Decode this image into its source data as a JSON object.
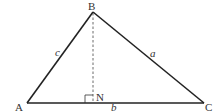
{
  "diagram": {
    "type": "triangle-with-altitude",
    "vertices": {
      "A": {
        "label": "A",
        "x": 27,
        "y": 103
      },
      "B": {
        "label": "B",
        "x": 93,
        "y": 12
      },
      "C": {
        "label": "C",
        "x": 204,
        "y": 103
      }
    },
    "foot": {
      "label": "N",
      "x": 93,
      "y": 103
    },
    "sides": {
      "a": {
        "label": "a",
        "between": "B-C"
      },
      "b": {
        "label": "b",
        "between": "A-C"
      },
      "c": {
        "label": "c",
        "between": "A-B"
      }
    },
    "altitude": {
      "from": "B",
      "to": "N",
      "style": "dashed"
    },
    "right_angle_marker": "N",
    "colors": {
      "stroke": "#222222",
      "text": "#333333",
      "background": "#ffffff"
    }
  }
}
